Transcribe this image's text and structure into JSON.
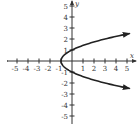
{
  "chart_data": {
    "type": "line",
    "title": "",
    "equation": "x = y^2 - 1",
    "xlabel": "x",
    "ylabel": "y",
    "xlim": [
      -5.5,
      5.8
    ],
    "ylim": [
      -5.5,
      5.5
    ],
    "x_ticks": [
      -5,
      -4,
      -3,
      -2,
      -1,
      1,
      2,
      3,
      4,
      5
    ],
    "y_ticks": [
      -5,
      -4,
      -3,
      -2,
      -1,
      1,
      2,
      3,
      4,
      5
    ],
    "grid": false,
    "series": [
      {
        "name": "parabola",
        "color": "#222222",
        "points": [
          {
            "x": 5.25,
            "y": 2.5
          },
          {
            "x": 3,
            "y": 2
          },
          {
            "x": 1.25,
            "y": 1.5
          },
          {
            "x": 0,
            "y": 1
          },
          {
            "x": -0.75,
            "y": 0.5
          },
          {
            "x": -1,
            "y": 0
          },
          {
            "x": -0.75,
            "y": -0.5
          },
          {
            "x": 0,
            "y": -1
          },
          {
            "x": 1.25,
            "y": -1.5
          },
          {
            "x": 3,
            "y": -2
          },
          {
            "x": 5.25,
            "y": -2.5
          }
        ],
        "arrows_at_ends": true
      }
    ]
  }
}
